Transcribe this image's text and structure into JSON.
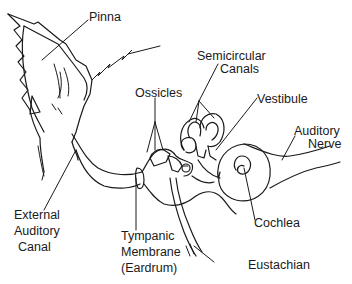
{
  "diagram": {
    "title": "",
    "style": {
      "line_color": "#1a1a1a",
      "background": "#ffffff"
    },
    "labels": {
      "pinna": "Pinna",
      "ossicles": "Ossicles",
      "semicircular_canals_line1": "Semicircular",
      "semicircular_canals_line2": "Canals",
      "vestibule": "Vestibule",
      "auditory_nerve_line1": "Auditory",
      "auditory_nerve_line2": "Nerve",
      "external_auditory_canal_line1": "External",
      "external_auditory_canal_line2": "Auditory",
      "external_auditory_canal_line3": "Canal",
      "tympanic_membrane_line1": "Tympanic",
      "tympanic_membrane_line2": "Membrane",
      "tympanic_membrane_line3": "(Eardrum)",
      "cochlea": "Cochlea",
      "eustachian": "Eustachian"
    }
  }
}
